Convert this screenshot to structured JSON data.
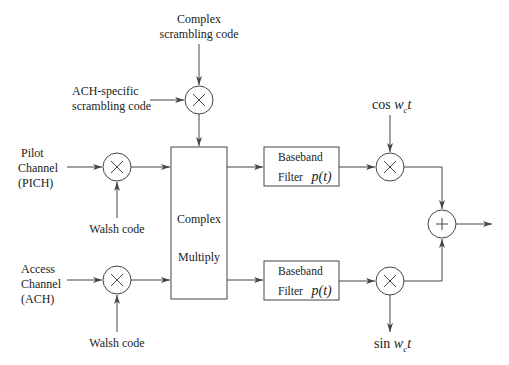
{
  "diagram": {
    "type": "block-diagram",
    "inputs": {
      "complex_scrambling": [
        "Complex",
        "scrambling code"
      ],
      "ach_scrambling": [
        "ACH-specific",
        "scrambling code"
      ],
      "pilot_channel": [
        "Pilot",
        "Channel",
        "(PICH)"
      ],
      "access_channel": [
        "Access",
        "Channel",
        "(ACH)"
      ],
      "walsh_top": "Walsh code",
      "walsh_bottom": "Walsh code"
    },
    "blocks": {
      "complex_multiply": [
        "Complex",
        "Multiply"
      ],
      "filter_upper": {
        "line1": "Baseband",
        "line2": "Filter",
        "fn": "p(t)"
      },
      "filter_lower": {
        "line1": "Baseband",
        "line2": "Filter",
        "fn": "p(t)"
      }
    },
    "carriers": {
      "cos": {
        "fn": "cos",
        "var": "w",
        "sub": "c",
        "t": "t"
      },
      "sin": {
        "fn": "sin",
        "var": "w",
        "sub": "c",
        "t": "t"
      }
    },
    "operators": {
      "multiply": "×",
      "sum": "+"
    }
  }
}
